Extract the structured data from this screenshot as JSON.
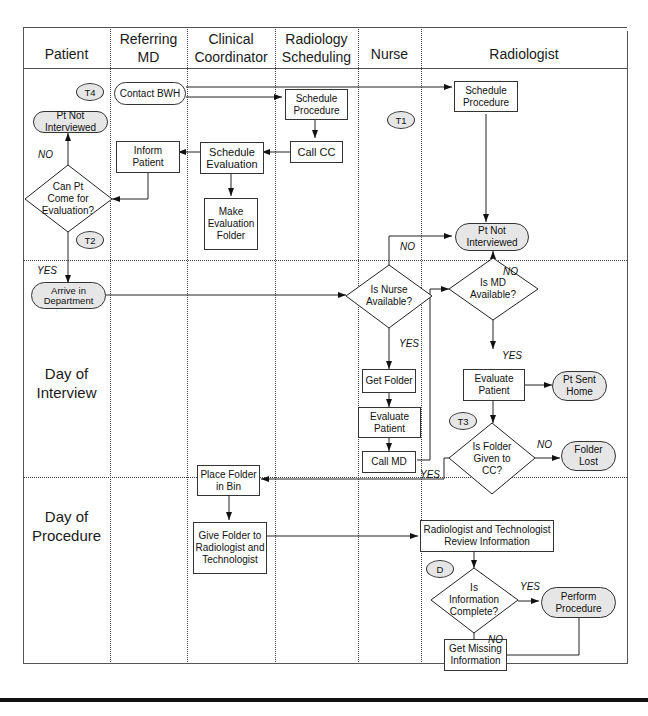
{
  "diagram": {
    "type": "swimlane-flowchart",
    "lanes": [
      {
        "id": "patient",
        "label": "Patient"
      },
      {
        "id": "referring_md",
        "label": "Referring MD"
      },
      {
        "id": "clinical_coordinator",
        "label": "Clinical Coordinator"
      },
      {
        "id": "radiology_scheduling",
        "label": "Radiology Scheduling"
      },
      {
        "id": "nurse",
        "label": "Nurse"
      },
      {
        "id": "radiologist",
        "label": "Radiologist"
      }
    ],
    "header": {
      "patient": "Patient",
      "referring_md_1": "Referring",
      "referring_md_2": "MD",
      "clinical_coordinator_1": "Clinical",
      "clinical_coordinator_2": "Coordinator",
      "radiology_scheduling_1": "Radiology",
      "radiology_scheduling_2": "Scheduling",
      "nurse": "Nurse",
      "radiologist": "Radiologist"
    },
    "phases": [
      {
        "id": "pre",
        "label": ""
      },
      {
        "id": "interview",
        "label_1": "Day of",
        "label_2": "Interview"
      },
      {
        "id": "procedure",
        "label_1": "Day of",
        "label_2": "Procedure"
      }
    ],
    "tags": {
      "t4": "T4",
      "t1": "T1",
      "t2": "T2",
      "t3": "T3",
      "d": "D"
    },
    "nodes": {
      "pt_not_interviewed_1": {
        "l1": "Pt Not",
        "l2": "Interviewed",
        "shape": "terminal"
      },
      "contact_bwh": {
        "l1": "Contact BWH",
        "shape": "terminal-white"
      },
      "schedule_procedure_rs": {
        "l1": "Schedule",
        "l2": "Procedure",
        "shape": "process"
      },
      "schedule_procedure_rad": {
        "l1": "Schedule",
        "l2": "Procedure",
        "shape": "process"
      },
      "call_cc": {
        "l1": "Call CC",
        "shape": "process"
      },
      "schedule_evaluation": {
        "l1": "Schedule",
        "l2": "Evaluation",
        "shape": "process"
      },
      "inform_patient": {
        "l1": "Inform",
        "l2": "Patient",
        "shape": "process"
      },
      "make_evaluation_folder": {
        "l1": "Make",
        "l2": "Evaluation",
        "l3": "Folder",
        "shape": "process"
      },
      "can_pt_come": {
        "l1": "Can Pt",
        "l2": "Come for",
        "l3": "Evaluation?",
        "shape": "decision"
      },
      "pt_not_interviewed_2": {
        "l1": "Pt Not",
        "l2": "Interviewed",
        "shape": "terminal"
      },
      "arrive_in_department": {
        "l1": "Arrive in",
        "l2": "Department",
        "shape": "terminal"
      },
      "is_nurse_available": {
        "l1": "Is Nurse",
        "l2": "Available?",
        "shape": "decision"
      },
      "is_md_available": {
        "l1": "Is MD",
        "l2": "Available?",
        "shape": "decision"
      },
      "get_folder": {
        "l1": "Get Folder",
        "shape": "process"
      },
      "evaluate_patient_nurse": {
        "l1": "Evaluate",
        "l2": "Patient",
        "shape": "process"
      },
      "call_md": {
        "l1": "Call MD",
        "shape": "process"
      },
      "evaluate_patient_rad": {
        "l1": "Evaluate",
        "l2": "Patient",
        "shape": "process"
      },
      "pt_sent_home": {
        "l1": "Pt Sent",
        "l2": "Home",
        "shape": "terminal"
      },
      "is_folder_given": {
        "l1": "Is Folder",
        "l2": "Given to",
        "l3": "CC?",
        "shape": "decision"
      },
      "folder_lost": {
        "l1": "Folder",
        "l2": "Lost",
        "shape": "terminal"
      },
      "place_folder_in_bin": {
        "l1": "Place Folder",
        "l2": "in Bin",
        "shape": "process"
      },
      "give_folder": {
        "l1": "Give Folder to",
        "l2": "Radiologist and",
        "l3": "Technologist",
        "shape": "process"
      },
      "review_information": {
        "l1": "Radiologist and Technologist",
        "l2": "Review Information",
        "shape": "process"
      },
      "is_information_complete": {
        "l1": "Is",
        "l2": "Information",
        "l3": "Complete?",
        "shape": "decision"
      },
      "perform_procedure": {
        "l1": "Perform",
        "l2": "Procedure",
        "shape": "terminal"
      },
      "get_missing_information": {
        "l1": "Get Missing",
        "l2": "Information",
        "shape": "process"
      }
    },
    "edge_labels": {
      "no_can_pt": "NO",
      "yes_can_pt": "YES",
      "no_nurse": "NO",
      "yes_nurse": "YES",
      "no_md": "NO",
      "yes_md": "YES",
      "no_folder": "NO",
      "yes_folder": "YES",
      "yes_info": "YES",
      "no_info": "NO"
    },
    "edges": [
      [
        "contact_bwh",
        "schedule_procedure_rs"
      ],
      [
        "contact_bwh",
        "schedule_procedure_rad"
      ],
      [
        "schedule_procedure_rs",
        "call_cc"
      ],
      [
        "call_cc",
        "schedule_evaluation"
      ],
      [
        "schedule_evaluation",
        "inform_patient"
      ],
      [
        "schedule_evaluation",
        "make_evaluation_folder"
      ],
      [
        "inform_patient",
        "can_pt_come"
      ],
      [
        "can_pt_come",
        "pt_not_interviewed_1",
        "NO"
      ],
      [
        "can_pt_come",
        "arrive_in_department",
        "YES"
      ],
      [
        "schedule_procedure_rad",
        "pt_not_interviewed_2"
      ],
      [
        "arrive_in_department",
        "is_nurse_available"
      ],
      [
        "is_nurse_available",
        "pt_not_interviewed_2",
        "NO"
      ],
      [
        "is_nurse_available",
        "get_folder",
        "YES"
      ],
      [
        "get_folder",
        "evaluate_patient_nurse"
      ],
      [
        "evaluate_patient_nurse",
        "call_md"
      ],
      [
        "call_md",
        "is_md_available"
      ],
      [
        "is_md_available",
        "pt_not_interviewed_2",
        "NO"
      ],
      [
        "is_md_available",
        "evaluate_patient_rad",
        "YES"
      ],
      [
        "evaluate_patient_rad",
        "pt_sent_home"
      ],
      [
        "evaluate_patient_rad",
        "is_folder_given"
      ],
      [
        "is_folder_given",
        "folder_lost",
        "NO"
      ],
      [
        "is_folder_given",
        "place_folder_in_bin",
        "YES"
      ],
      [
        "place_folder_in_bin",
        "give_folder"
      ],
      [
        "give_folder",
        "review_information"
      ],
      [
        "review_information",
        "is_information_complete"
      ],
      [
        "is_information_complete",
        "perform_procedure",
        "YES"
      ],
      [
        "is_information_complete",
        "get_missing_information",
        "NO"
      ],
      [
        "get_missing_information",
        "perform_procedure"
      ]
    ]
  }
}
